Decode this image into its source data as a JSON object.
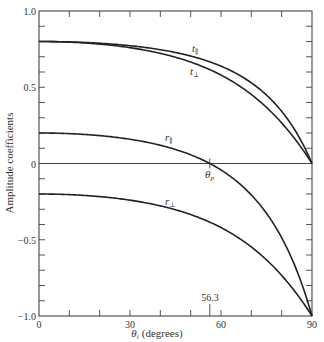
{
  "chart_data": {
    "type": "line",
    "title": "",
    "xlabel": "θi (degrees)",
    "ylabel": "Amplitude coefficients",
    "xlim": [
      0,
      90
    ],
    "ylim": [
      -1.0,
      1.0
    ],
    "grid": false,
    "legend": "inline curve labels",
    "x_ticks": [
      0,
      10,
      20,
      30,
      40,
      50,
      60,
      70,
      80,
      90
    ],
    "x_tick_labels": [
      "0",
      "30",
      "60",
      "90"
    ],
    "x_tick_label_values": [
      0,
      30,
      60,
      90
    ],
    "y_ticks": [
      -1.0,
      -0.9,
      -0.8,
      -0.7,
      -0.6,
      -0.5,
      -0.4,
      -0.3,
      -0.2,
      -0.1,
      0,
      0.1,
      0.2,
      0.3,
      0.4,
      0.5,
      0.6,
      0.7,
      0.8,
      0.9,
      1.0
    ],
    "y_tick_labels": [
      "1.0",
      "0.5",
      "0",
      "−0.5",
      "−1.0"
    ],
    "y_tick_label_values": [
      1.0,
      0.5,
      0,
      -0.5,
      -1.0
    ],
    "refractive_index_ratio": 1.5,
    "annotations": [
      {
        "text": "θp",
        "x": 56.3,
        "y": 0
      },
      {
        "text": "56.3",
        "x": 56.3,
        "y": -1.0
      }
    ],
    "x": [
      0,
      10,
      20,
      30,
      40,
      50,
      56.3,
      60,
      70,
      80,
      90
    ],
    "series": [
      {
        "name": "t∥",
        "values": [
          0.8,
          0.801,
          0.805,
          0.812,
          0.818,
          0.817,
          0.806,
          0.793,
          0.723,
          0.532,
          0.0
        ]
      },
      {
        "name": "t⊥",
        "values": [
          0.8,
          0.798,
          0.788,
          0.772,
          0.746,
          0.702,
          0.667,
          0.639,
          0.547,
          0.361,
          0.0
        ]
      },
      {
        "name": "r∥",
        "values": [
          0.2,
          0.197,
          0.185,
          0.159,
          0.114,
          0.043,
          0.0,
          -0.042,
          -0.246,
          -0.598,
          -1.0
        ]
      },
      {
        "name": "r⊥",
        "values": [
          -0.2,
          -0.204,
          -0.217,
          -0.24,
          -0.281,
          -0.344,
          -0.385,
          -0.42,
          -0.547,
          -0.723,
          -1.0
        ]
      }
    ]
  },
  "labels": {
    "t_par": "t",
    "t_par_sub": "∥",
    "t_perp": "t",
    "t_perp_sub": "⊥",
    "r_par": "r",
    "r_par_sub": "∥",
    "r_perp": "r",
    "r_perp_sub": "⊥",
    "theta_p": "θ",
    "theta_p_sub": "p",
    "brewster_value": "56.3",
    "xlabel_theta": "θ",
    "xlabel_sub": "i",
    "xlabel_units": "(degrees)",
    "ylabel": "Amplitude coefficients"
  }
}
